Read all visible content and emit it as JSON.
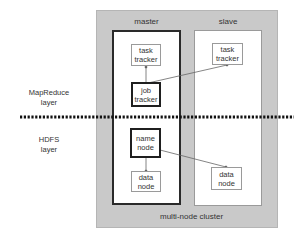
{
  "diagram": {
    "cluster": {
      "label": "multi-node cluster",
      "fill": "#c9c9c9"
    },
    "layers": [
      {
        "id": "mapreduce",
        "label_line1": "MapReduce",
        "label_line2": "layer"
      },
      {
        "id": "hdfs",
        "label_line1": "HDFS",
        "label_line2": "layer"
      }
    ],
    "divider": {
      "style": "dotted",
      "color": "#111111"
    },
    "columns": {
      "master": {
        "title": "master",
        "nodes": {
          "task_tracker": {
            "line1": "task",
            "line2": "tracker",
            "emphasis": false
          },
          "job_tracker": {
            "line1": "job",
            "line2": "tracker",
            "emphasis": true
          },
          "name_node": {
            "line1": "name",
            "line2": "node",
            "emphasis": true
          },
          "data_node": {
            "line1": "data",
            "line2": "node",
            "emphasis": false
          }
        }
      },
      "slave": {
        "title": "slave",
        "nodes": {
          "task_tracker": {
            "line1": "task",
            "line2": "tracker",
            "emphasis": false
          },
          "data_node": {
            "line1": "data",
            "line2": "node",
            "emphasis": false
          }
        }
      }
    },
    "edges": [
      {
        "from": "master.job_tracker",
        "to": "master.task_tracker"
      },
      {
        "from": "master.job_tracker",
        "to": "slave.task_tracker"
      },
      {
        "from": "master.name_node",
        "to": "master.data_node"
      },
      {
        "from": "master.name_node",
        "to": "slave.data_node"
      }
    ]
  }
}
